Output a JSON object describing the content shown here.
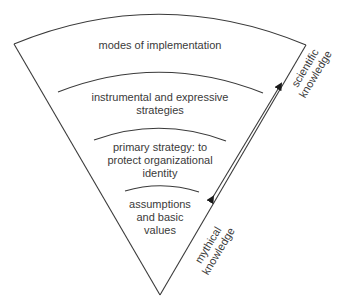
{
  "diagram": {
    "type": "funnel",
    "layers": [
      {
        "id": "layer-1",
        "label": "modes of implementation"
      },
      {
        "id": "layer-2",
        "label": "instrumental and expressive strategies",
        "lines": [
          "instrumental and expressive",
          "strategies"
        ]
      },
      {
        "id": "layer-3",
        "label": "primary strategy: to protect organizational identity",
        "lines": [
          "primary strategy: to",
          "protect organizational",
          "identity"
        ]
      },
      {
        "id": "layer-4",
        "label": "assumptions and basic values",
        "lines": [
          "assumptions",
          "and basic",
          "values"
        ]
      }
    ],
    "axis": {
      "top_label_lines": [
        "scientific",
        "knowledge"
      ],
      "bottom_label_lines": [
        "mythical",
        "knowledge"
      ],
      "arrow": "bidirectional"
    },
    "colors": {
      "line": "#3a3a3a",
      "text": "#3a3a3a",
      "background": "#ffffff"
    }
  }
}
